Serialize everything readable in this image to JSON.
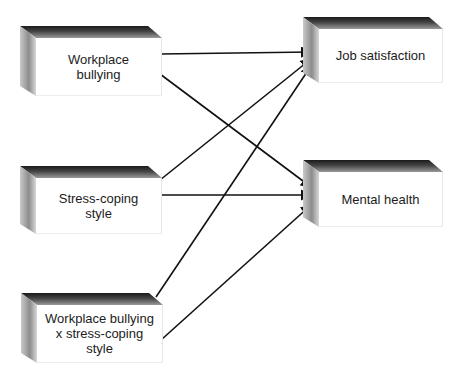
{
  "diagram": {
    "type": "path-model",
    "predictors": [
      {
        "id": "workplace_bullying",
        "label": "Workplace bullying"
      },
      {
        "id": "stress_coping",
        "label": "Stress-coping style"
      },
      {
        "id": "interaction",
        "label": "Workplace bullying x stress-coping style"
      }
    ],
    "outcomes": [
      {
        "id": "job_satisfaction",
        "label": "Job satisfaction"
      },
      {
        "id": "mental_health",
        "label": "Mental health"
      }
    ],
    "edges": [
      {
        "from": "workplace_bullying",
        "to": "job_satisfaction"
      },
      {
        "from": "workplace_bullying",
        "to": "mental_health"
      },
      {
        "from": "stress_coping",
        "to": "job_satisfaction"
      },
      {
        "from": "stress_coping",
        "to": "mental_health"
      },
      {
        "from": "interaction",
        "to": "job_satisfaction"
      },
      {
        "from": "interaction",
        "to": "mental_health"
      }
    ]
  },
  "boxes": {
    "wb": {
      "line1": "Workplace",
      "line2": "bullying"
    },
    "sc": {
      "line1": "Stress-coping",
      "line2": "style"
    },
    "int": {
      "line1": "Workplace bullying",
      "line2": "x stress-coping",
      "line3": "style"
    },
    "js": {
      "line1": "Job satisfaction"
    },
    "mh": {
      "line1": "Mental health"
    }
  },
  "colors": {
    "arrow": "#111111",
    "face": "#ffffff",
    "bevel_dark": "#1a1a1a",
    "bevel_light": "#c9c9c9",
    "text": "#1c1c1c"
  }
}
